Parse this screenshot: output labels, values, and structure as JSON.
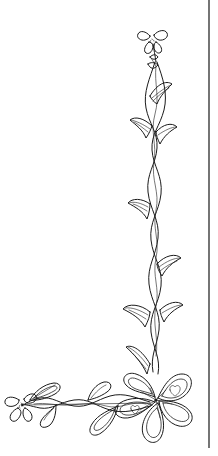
{
  "image": {
    "title": "Floral corner border line drawing",
    "background_color": "#ffffff",
    "ink_color": "#1a1a1a",
    "width": 218,
    "height": 456
  },
  "border_rule": {
    "name": "right-margin-rule",
    "color": "#3a3a3a",
    "x": 209,
    "y_start": 0,
    "y_end": 448
  },
  "elements": {
    "top_flower": {
      "label": "small four-petal flower",
      "cx": 152,
      "cy": 40
    },
    "vertical_vine": {
      "label": "braided vertical vine stem",
      "x": 155,
      "y_start": 48,
      "y_end": 372
    },
    "corner_flower": {
      "label": "large five-petal corner flower",
      "cx": 158,
      "cy": 400
    },
    "horizontal_vine": {
      "label": "braided horizontal vine stem",
      "y": 400,
      "x_start": 22,
      "x_end": 150
    },
    "left_flower": {
      "label": "small four-petal end flower",
      "cx": 22,
      "cy": 405
    },
    "trumpet_leaves_count": 9
  }
}
